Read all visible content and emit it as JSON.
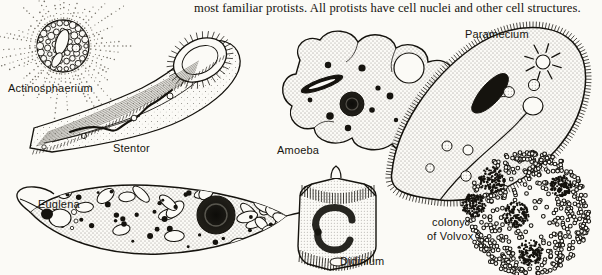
{
  "page": {
    "background_color": "#fbfaf6",
    "ink_color": "#15130e",
    "width": 602,
    "height": 275
  },
  "body_text": {
    "paragraph": "most familiar protists. All protists have cell nuclei and other cell structures."
  },
  "figure": {
    "caption_labels": [
      {
        "id": "actinosphaerium",
        "text": "Actinosphaerium",
        "x": 8,
        "y": 92
      },
      {
        "id": "stentor",
        "text": "Stentor",
        "x": 113,
        "y": 152
      },
      {
        "id": "euglena",
        "text": "Euglena",
        "x": 38,
        "y": 208
      },
      {
        "id": "amoeba",
        "text": "Amoeba",
        "x": 277,
        "y": 154
      },
      {
        "id": "didinium",
        "text": "Didinium",
        "x": 340,
        "y": 265
      },
      {
        "id": "paramecium",
        "text": "Paramecium",
        "x": 465,
        "y": 38
      },
      {
        "id": "volvox-line1",
        "text": "colony",
        "x": 432,
        "y": 226
      },
      {
        "id": "volvox-line2",
        "text": "of Volvox",
        "x": 427,
        "y": 240
      }
    ],
    "organisms": [
      {
        "name": "Actinosphaerium",
        "common_description": "heliozoan with radiating axopodia and vacuolated cortex",
        "position": {
          "x": 63,
          "y": 46
        },
        "features": [
          "axopodia",
          "cortical vacuoles",
          "central capsule"
        ]
      },
      {
        "name": "Stentor",
        "common_description": "trumpet-shaped ciliate with beaded macronucleus",
        "position": {
          "x": 120,
          "y": 95
        },
        "features": [
          "oral cilia",
          "contractile stalk",
          "beaded macronucleus",
          "contractile vacuoles"
        ]
      },
      {
        "name": "Euglena",
        "common_description": "spindle-shaped flagellate with chloroplasts and large nucleus",
        "position": {
          "x": 160,
          "y": 222
        },
        "features": [
          "nucleus",
          "chloroplasts",
          "eyespot",
          "reservoir",
          "flagellum"
        ]
      },
      {
        "name": "Amoeba",
        "common_description": "lobed sarcodine with pseudopodia and granular cytoplasm",
        "position": {
          "x": 360,
          "y": 95
        },
        "features": [
          "pseudopodia",
          "nucleus",
          "contractile vacuole",
          "food vacuoles"
        ]
      },
      {
        "name": "Didinium",
        "common_description": "barrel-shaped ciliate with two ciliary girdles",
        "position": {
          "x": 340,
          "y": 222
        },
        "features": [
          "ciliary girdles",
          "proboscis",
          "C-shaped macronucleus"
        ]
      },
      {
        "name": "Paramecium",
        "common_description": "slipper-shaped ciliate covered in cilia",
        "position": {
          "x": 500,
          "y": 130
        },
        "features": [
          "cilia",
          "macronucleus",
          "contractile vacuoles with radiating canals",
          "oral groove",
          "gullet",
          "food vacuoles"
        ]
      },
      {
        "name": "colony of Volvox",
        "common_description": "spherical green-algal colony containing daughter colonies",
        "position": {
          "x": 530,
          "y": 215
        },
        "features": [
          "somatic cells",
          "daughter colonies"
        ]
      }
    ]
  }
}
